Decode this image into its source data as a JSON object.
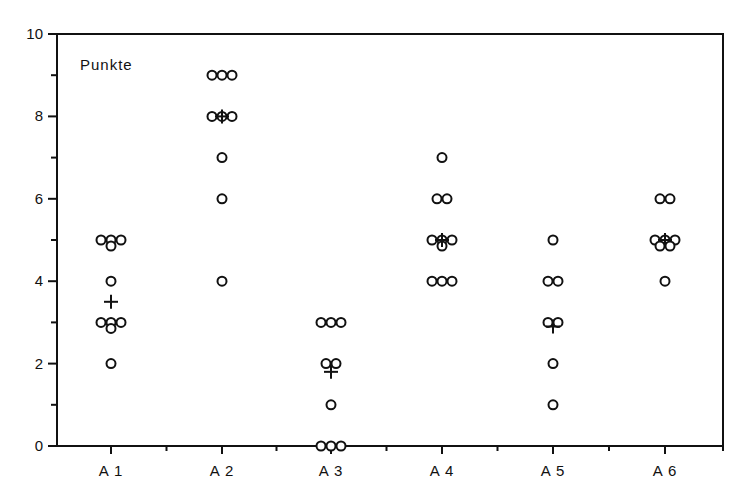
{
  "chart_data": {
    "type": "scatter",
    "subtype": "dot-plot with group means",
    "title": "Punkte",
    "xlabel": "",
    "ylabel": "",
    "categories": [
      "A 1",
      "A 2",
      "A 3",
      "A 4",
      "A 5",
      "A 6"
    ],
    "ylim": [
      0,
      10
    ],
    "yticks_major": [
      0,
      2,
      4,
      6,
      8,
      10
    ],
    "yticks_minor": [
      1,
      3,
      5,
      7,
      9
    ],
    "grid": false,
    "legend": null,
    "series": [
      {
        "name": "A 1",
        "points": [
          5,
          5,
          5,
          5,
          4,
          3,
          3,
          3,
          3,
          2
        ],
        "mean": 3.5
      },
      {
        "name": "A 2",
        "points": [
          9,
          9,
          9,
          8,
          8,
          8,
          7,
          6,
          4
        ],
        "mean": 8.0
      },
      {
        "name": "A 3",
        "points": [
          3,
          3,
          3,
          2,
          2,
          1,
          0,
          0,
          0
        ],
        "mean": 1.8
      },
      {
        "name": "A 4",
        "points": [
          7,
          6,
          6,
          5,
          5,
          5,
          5,
          4,
          4,
          4
        ],
        "mean": 5.0
      },
      {
        "name": "A 5",
        "points": [
          5,
          4,
          4,
          3,
          3,
          2,
          1
        ],
        "mean": 2.9
      },
      {
        "name": "A 6",
        "points": [
          6,
          6,
          5,
          5,
          5,
          5,
          5,
          4
        ],
        "mean": 5.0
      }
    ],
    "markers": {
      "points": "open-circle",
      "mean": "plus"
    }
  },
  "colors": {
    "ink": "#111111",
    "background": "#ffffff"
  }
}
